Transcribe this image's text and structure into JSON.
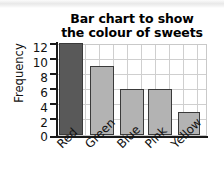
{
  "chart_data": {
    "type": "bar",
    "title": "Bar chart to show the colour of sweets",
    "title_lines": [
      "Bar chart to show",
      "the colour of sweets"
    ],
    "categories": [
      "Red",
      "Green",
      "Blue",
      "Pink",
      "Yellow"
    ],
    "values": [
      12,
      9,
      6,
      6,
      3
    ],
    "bar_colors": [
      "#595959",
      "#b3b3b3",
      "#b3b3b3",
      "#b3b3b3",
      "#b3b3b3"
    ],
    "bar_border_color": "#3a3a3a",
    "xlabel": "",
    "ylabel": "Frequency",
    "ylim": [
      0,
      12
    ],
    "ytick_labels": [
      "12",
      "10",
      "8",
      "6",
      "4",
      "2",
      "0"
    ],
    "ytick_values": [
      12,
      10,
      8,
      6,
      4,
      2,
      0
    ],
    "ytick_step": 2,
    "grid": true,
    "grid_color": "#cfcfcf",
    "legend": "none",
    "axis_color": "#1a1a1a",
    "x_label_rotation": -45
  }
}
